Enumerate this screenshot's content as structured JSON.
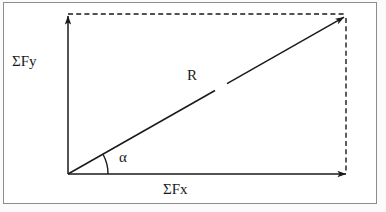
{
  "figure": {
    "type": "vector-parallelogram",
    "background_color": "#ffffff",
    "frame_color": "#8c8c8c",
    "stroke_color": "#1a1a1a",
    "labels": {
      "sum_fy": "ΣFy",
      "sum_fx": "ΣFx",
      "resultant": "R",
      "angle": "α"
    },
    "vectors": [
      {
        "name": "sum_fy",
        "label": "ΣFy",
        "style": "solid",
        "arrowhead": "end",
        "from": [
          68,
          174
        ],
        "to": [
          68,
          14
        ]
      },
      {
        "name": "sum_fx",
        "label": "ΣFx",
        "style": "solid",
        "arrowhead": "end",
        "from": [
          68,
          174
        ],
        "to": [
          348,
          174
        ]
      },
      {
        "name": "resultant",
        "label": "R",
        "style": "solid",
        "arrowhead": "end",
        "from": [
          68,
          174
        ],
        "to": [
          346,
          16
        ]
      }
    ],
    "construction_lines": [
      {
        "name": "top-projection",
        "style": "dashed",
        "from": [
          68,
          14
        ],
        "to": [
          346,
          14
        ]
      },
      {
        "name": "right-projection",
        "style": "dashed",
        "from": [
          346,
          16
        ],
        "to": [
          346,
          174
        ]
      }
    ],
    "angle_arc": {
      "name": "alpha-arc",
      "label": "α",
      "vertex": [
        68,
        174
      ],
      "radius": 40,
      "from_deg": 0,
      "to_deg": 30
    }
  }
}
